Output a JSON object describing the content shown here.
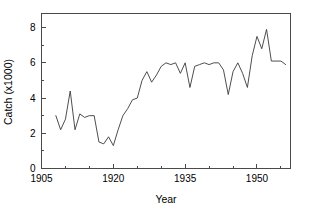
{
  "chart_data": {
    "type": "line",
    "title": "",
    "xlabel": "Year",
    "ylabel": "Catch (x1000)",
    "xlim": [
      1905,
      1957
    ],
    "ylim": [
      0,
      8.8
    ],
    "grid": false,
    "legend": "none",
    "xticks": [
      1905,
      1920,
      1935,
      1950
    ],
    "xticks_minor": [
      1910,
      1915,
      1925,
      1930,
      1940,
      1945,
      1955
    ],
    "yticks": [
      0,
      2,
      4,
      6,
      8
    ],
    "yticks_minor": [
      1,
      3,
      5,
      7
    ],
    "xtick_labels": [
      "1905",
      "1920",
      "1935",
      "1950"
    ],
    "ytick_labels": [
      "0",
      "2",
      "4",
      "6",
      "8"
    ],
    "series": [
      {
        "name": "Catch",
        "color": "#3a3a3a",
        "x": [
          1908,
          1909,
          1910,
          1911,
          1912,
          1913,
          1914,
          1915,
          1916,
          1917,
          1918,
          1919,
          1920,
          1921,
          1922,
          1923,
          1924,
          1925,
          1926,
          1927,
          1928,
          1929,
          1930,
          1931,
          1932,
          1933,
          1934,
          1935,
          1936,
          1937,
          1938,
          1939,
          1940,
          1941,
          1942,
          1943,
          1944,
          1945,
          1946,
          1947,
          1948,
          1949,
          1950,
          1951,
          1952,
          1953,
          1954,
          1955,
          1956
        ],
        "values": [
          3.0,
          2.2,
          2.8,
          4.4,
          2.2,
          3.1,
          2.9,
          3.0,
          3.0,
          1.5,
          1.4,
          1.8,
          1.3,
          2.2,
          3.0,
          3.4,
          3.9,
          4.0,
          5.0,
          5.5,
          4.9,
          5.3,
          5.8,
          6.0,
          5.9,
          6.0,
          5.4,
          6.0,
          4.6,
          5.8,
          5.9,
          6.0,
          5.9,
          6.0,
          6.0,
          5.6,
          4.2,
          5.5,
          6.0,
          5.4,
          4.6,
          6.4,
          7.5,
          6.8,
          7.9,
          6.1,
          6.1,
          6.1,
          5.9
        ]
      }
    ]
  },
  "axes": {
    "ylabel_text": "Catch (x1000)",
    "xlabel_text": "Year"
  }
}
